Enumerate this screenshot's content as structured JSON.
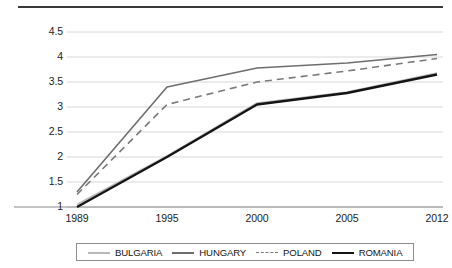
{
  "chart_data": {
    "type": "line",
    "title": "",
    "xlabel": "",
    "ylabel": "",
    "categories": [
      "1989",
      "1995",
      "2000",
      "2005",
      "2012"
    ],
    "ylim": [
      1,
      4.5
    ],
    "yticks": [
      "1",
      "1.5",
      "2",
      "2.5",
      "3",
      "3.5",
      "4",
      "4.5"
    ],
    "ytick_values": [
      1,
      1.5,
      2,
      2.5,
      3,
      3.5,
      4,
      4.5
    ],
    "grid": true,
    "legend_position": "bottom",
    "series": [
      {
        "name": "BULGARIA",
        "values": [
          1.05,
          2.02,
          3.08,
          3.3,
          3.68
        ],
        "color": "#b9b9b9",
        "width": 1.6,
        "dash": "none"
      },
      {
        "name": "HUNGARY",
        "values": [
          1.3,
          3.4,
          3.78,
          3.88,
          4.05
        ],
        "color": "#6e6e6e",
        "width": 1.6,
        "dash": "none"
      },
      {
        "name": "POLAND",
        "values": [
          1.25,
          3.05,
          3.5,
          3.72,
          3.97
        ],
        "color": "#7a7a7a",
        "width": 1.6,
        "dash": "7,5"
      },
      {
        "name": "ROMANIA",
        "values": [
          1.0,
          2.0,
          3.05,
          3.28,
          3.65
        ],
        "color": "#141414",
        "width": 2.4,
        "dash": "none"
      }
    ]
  },
  "axis": {
    "grid_color": "#d8d8d8",
    "baseline_color": "#8a8a8a"
  }
}
